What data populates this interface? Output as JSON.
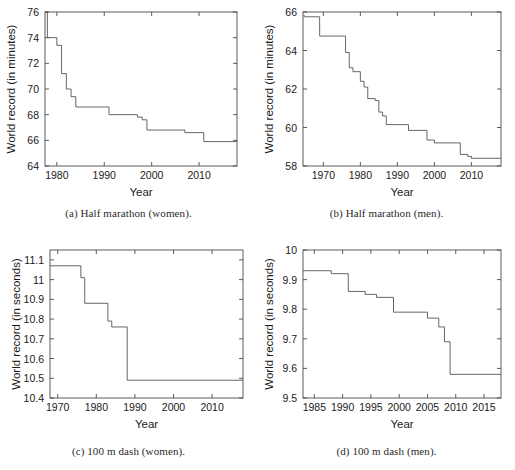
{
  "figure": {
    "panels": [
      {
        "id": "a",
        "caption": "(a) Half marathon (women).",
        "chart_data": {
          "type": "line",
          "title": "",
          "xlabel": "Year",
          "ylabel": "World record (in minutes)",
          "xlim": [
            1977.5,
            2018
          ],
          "ylim": [
            64,
            76
          ],
          "xticks": [
            1980,
            1990,
            2000,
            2010
          ],
          "yticks": [
            64,
            66,
            68,
            70,
            72,
            74,
            76
          ],
          "grid": false,
          "legend": "none",
          "step_style": "post",
          "x": [
            1977.5,
            1978,
            1979,
            1980,
            1981,
            1982,
            1983,
            1984,
            1991,
            1997,
            1998,
            1999,
            2007,
            2011,
            2018
          ],
          "y": [
            76.0,
            74.0,
            74.0,
            73.4,
            71.2,
            70.0,
            69.4,
            68.6,
            68.0,
            67.8,
            67.6,
            66.8,
            66.6,
            65.9,
            65.9
          ]
        }
      },
      {
        "id": "b",
        "caption": "(b) Half marathon (men).",
        "chart_data": {
          "type": "line",
          "title": "",
          "xlabel": "Year",
          "ylabel": "World record (in minutes)",
          "xlim": [
            1964.5,
            2018
          ],
          "ylim": [
            58,
            66
          ],
          "xticks": [
            1970,
            1980,
            1990,
            2000,
            2010
          ],
          "yticks": [
            58,
            60,
            62,
            64,
            66
          ],
          "grid": false,
          "legend": "none",
          "step_style": "post",
          "x": [
            1964.5,
            1965,
            1969,
            1976,
            1977,
            1978,
            1980,
            1981,
            1982,
            1984,
            1985,
            1986,
            1987,
            1993,
            1998,
            2000,
            2007,
            2009,
            2010,
            2018
          ],
          "y": [
            65.8,
            65.75,
            64.75,
            63.9,
            63.1,
            62.9,
            62.4,
            62.1,
            61.5,
            61.4,
            60.8,
            60.6,
            60.15,
            59.85,
            59.35,
            59.2,
            58.6,
            58.5,
            58.4,
            58.4
          ]
        }
      },
      {
        "id": "c",
        "caption": "(c) 100 m dash (women).",
        "chart_data": {
          "type": "line",
          "title": "",
          "xlabel": "Year",
          "ylabel": "World record (in seconds)",
          "xlim": [
            1968,
            2018
          ],
          "ylim": [
            10.4,
            11.15
          ],
          "xticks": [
            1970,
            1980,
            1990,
            2000,
            2010
          ],
          "yticks": [
            10.4,
            10.5,
            10.6,
            10.7,
            10.8,
            10.9,
            11.0,
            11.1
          ],
          "ytick_labels": [
            "10.4",
            "10.5",
            "10.6",
            "10.7",
            "10.8",
            "10.9",
            "11",
            "11.1"
          ],
          "grid": false,
          "legend": "none",
          "step_style": "post",
          "x": [
            1968,
            1976,
            1977,
            1983,
            1984,
            1988,
            2018
          ],
          "y": [
            11.07,
            11.01,
            10.88,
            10.79,
            10.76,
            10.49,
            10.49
          ]
        }
      },
      {
        "id": "d",
        "caption": "(d) 100 m dash (men).",
        "chart_data": {
          "type": "line",
          "title": "",
          "xlabel": "Year",
          "ylabel": "World record (in seconds)",
          "xlim": [
            1983,
            2018
          ],
          "ylim": [
            9.5,
            10.0
          ],
          "xticks": [
            1985,
            1990,
            1995,
            2000,
            2005,
            2010,
            2015
          ],
          "yticks": [
            9.5,
            9.6,
            9.7,
            9.8,
            9.9,
            10.0
          ],
          "ytick_labels": [
            "9.5",
            "9.6",
            "9.7",
            "9.8",
            "9.9",
            "10"
          ],
          "grid": false,
          "legend": "none",
          "step_style": "post",
          "x": [
            1983,
            1988,
            1991,
            1994,
            1996,
            1999,
            2005,
            2007,
            2008,
            2009,
            2018
          ],
          "y": [
            9.93,
            9.92,
            9.86,
            9.85,
            9.84,
            9.79,
            9.77,
            9.74,
            9.69,
            9.58,
            9.58
          ]
        }
      }
    ]
  }
}
